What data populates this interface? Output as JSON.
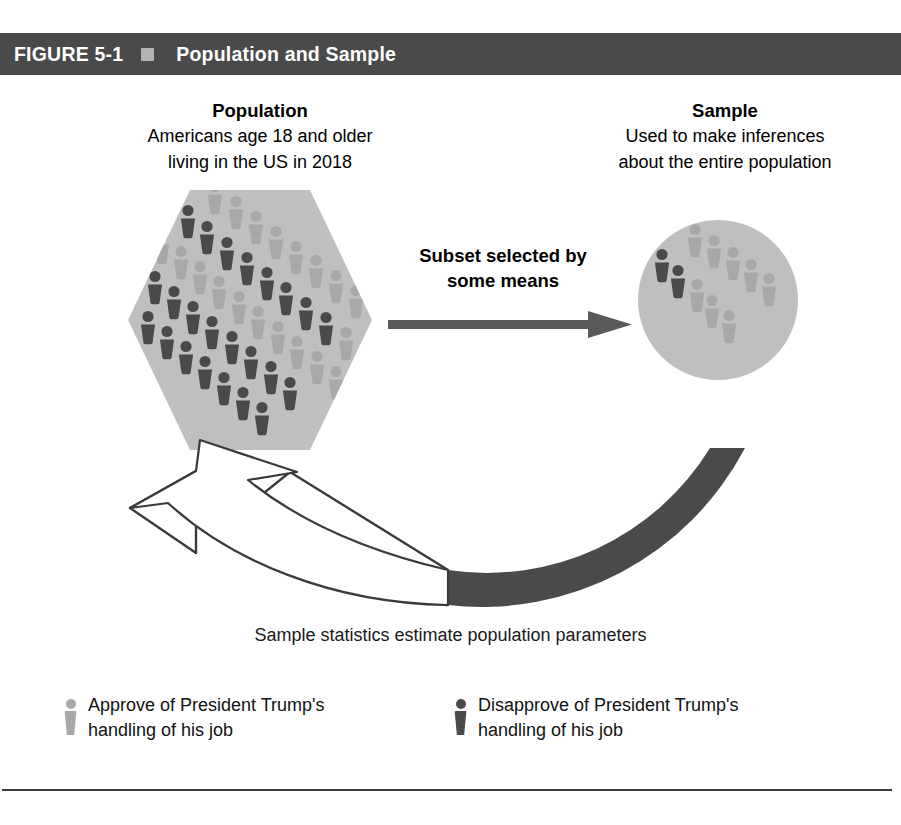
{
  "header": {
    "figure_label": "FIGURE 5-1",
    "marker_icon": "square-bullet-icon",
    "title": "Population and Sample",
    "bar_color": "#4a4a4a",
    "marker_color": "#b3b3b3"
  },
  "population": {
    "heading": "Population",
    "description_line1": "Americans age 18 and older",
    "description_line2": "living in the US in 2018",
    "shape": "hexagon",
    "shape_fill": "#bfbfbf",
    "figure_count": 44
  },
  "sample": {
    "heading": "Sample",
    "description_line1": "Used to make inferences",
    "description_line2": "about the entire population",
    "shape": "circle",
    "shape_fill": "#bfbfbf",
    "figure_count": 10
  },
  "subset_arrow": {
    "label_line1": "Subset selected by",
    "label_line2": "some means",
    "direction": "right",
    "color": "#5a5a5a"
  },
  "return_arrow": {
    "direction": "up-left",
    "fill_dark": "#4a4a4a",
    "stroke": "#3b3b3b",
    "fill_light": "#ffffff"
  },
  "bottom_caption": "Sample statistics estimate population parameters",
  "legend": {
    "items": [
      {
        "swatch_icon": "person-icon",
        "swatch_color": "#a8a8a8",
        "line1": "Approve of President Trump's",
        "line2": "handling of his job"
      },
      {
        "swatch_icon": "person-icon",
        "swatch_color": "#4a4a4a",
        "line1": "Disapprove of President Trump's",
        "line2": "handling of his job"
      }
    ]
  },
  "colors": {
    "light_person": "#a8a8a8",
    "dark_person": "#4a4a4a",
    "shape_fill": "#bfbfbf",
    "background": "#ffffff"
  },
  "population_people": [
    {
      "x": 215,
      "y": 198,
      "tone": "light"
    },
    {
      "x": 236,
      "y": 213,
      "tone": "light"
    },
    {
      "x": 188,
      "y": 222,
      "tone": "dark"
    },
    {
      "x": 256,
      "y": 228,
      "tone": "light"
    },
    {
      "x": 207,
      "y": 238,
      "tone": "dark"
    },
    {
      "x": 276,
      "y": 243,
      "tone": "light"
    },
    {
      "x": 162,
      "y": 248,
      "tone": "light"
    },
    {
      "x": 227,
      "y": 254,
      "tone": "dark"
    },
    {
      "x": 296,
      "y": 258,
      "tone": "light"
    },
    {
      "x": 181,
      "y": 263,
      "tone": "light"
    },
    {
      "x": 247,
      "y": 269,
      "tone": "dark"
    },
    {
      "x": 136,
      "y": 272,
      "tone": "dark"
    },
    {
      "x": 316,
      "y": 272,
      "tone": "light"
    },
    {
      "x": 200,
      "y": 278,
      "tone": "light"
    },
    {
      "x": 267,
      "y": 284,
      "tone": "dark"
    },
    {
      "x": 155,
      "y": 288,
      "tone": "dark"
    },
    {
      "x": 336,
      "y": 287,
      "tone": "light"
    },
    {
      "x": 219,
      "y": 293,
      "tone": "light"
    },
    {
      "x": 286,
      "y": 299,
      "tone": "dark"
    },
    {
      "x": 174,
      "y": 303,
      "tone": "dark"
    },
    {
      "x": 239,
      "y": 308,
      "tone": "light"
    },
    {
      "x": 306,
      "y": 314,
      "tone": "dark"
    },
    {
      "x": 356,
      "y": 302,
      "tone": "light"
    },
    {
      "x": 193,
      "y": 318,
      "tone": "dark"
    },
    {
      "x": 258,
      "y": 323,
      "tone": "light"
    },
    {
      "x": 326,
      "y": 329,
      "tone": "dark"
    },
    {
      "x": 148,
      "y": 328,
      "tone": "dark"
    },
    {
      "x": 212,
      "y": 333,
      "tone": "dark"
    },
    {
      "x": 278,
      "y": 338,
      "tone": "light"
    },
    {
      "x": 346,
      "y": 344,
      "tone": "light"
    },
    {
      "x": 167,
      "y": 343,
      "tone": "dark"
    },
    {
      "x": 232,
      "y": 348,
      "tone": "dark"
    },
    {
      "x": 297,
      "y": 353,
      "tone": "light"
    },
    {
      "x": 366,
      "y": 358,
      "tone": "light"
    },
    {
      "x": 186,
      "y": 358,
      "tone": "dark"
    },
    {
      "x": 251,
      "y": 363,
      "tone": "dark"
    },
    {
      "x": 317,
      "y": 368,
      "tone": "light"
    },
    {
      "x": 205,
      "y": 373,
      "tone": "dark"
    },
    {
      "x": 271,
      "y": 378,
      "tone": "dark"
    },
    {
      "x": 336,
      "y": 383,
      "tone": "light"
    },
    {
      "x": 224,
      "y": 389,
      "tone": "dark"
    },
    {
      "x": 290,
      "y": 394,
      "tone": "dark"
    },
    {
      "x": 243,
      "y": 404,
      "tone": "dark"
    },
    {
      "x": 262,
      "y": 419,
      "tone": "dark"
    }
  ],
  "sample_people": [
    {
      "x": 695,
      "y": 241,
      "tone": "light"
    },
    {
      "x": 714,
      "y": 252,
      "tone": "light"
    },
    {
      "x": 733,
      "y": 264,
      "tone": "light"
    },
    {
      "x": 751,
      "y": 276,
      "tone": "light"
    },
    {
      "x": 769,
      "y": 290,
      "tone": "light"
    },
    {
      "x": 662,
      "y": 266,
      "tone": "dark"
    },
    {
      "x": 678,
      "y": 282,
      "tone": "dark"
    },
    {
      "x": 697,
      "y": 296,
      "tone": "light"
    },
    {
      "x": 712,
      "y": 312,
      "tone": "light"
    },
    {
      "x": 729,
      "y": 327,
      "tone": "light"
    }
  ]
}
